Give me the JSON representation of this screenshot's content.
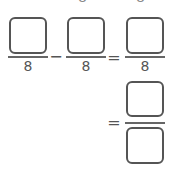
{
  "top_partial": {
    "left_digit": "8",
    "right_digit": "8"
  },
  "row1": {
    "fraction1": {
      "numerator": "",
      "denominator": "8"
    },
    "operator": "−",
    "fraction2": {
      "numerator": "",
      "denominator": "8"
    },
    "equals": "=",
    "fraction3": {
      "numerator": "",
      "denominator": "8"
    }
  },
  "row2": {
    "equals": "=",
    "fraction": {
      "numerator": "",
      "denominator": ""
    }
  }
}
